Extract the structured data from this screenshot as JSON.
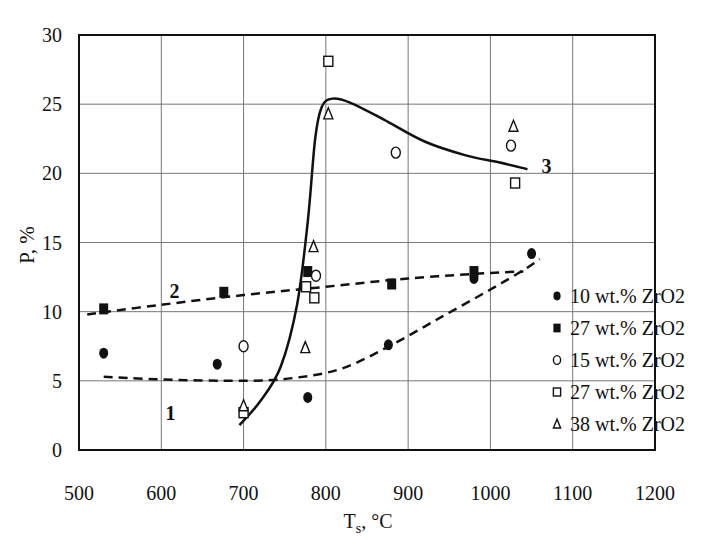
{
  "chart_data": {
    "type": "scatter",
    "title": "",
    "xlabel": "Ts, °C",
    "xlabel_main": "T",
    "xlabel_sub": "s",
    "xlabel_unit": ", °C",
    "ylabel": "P, %",
    "xlim": [
      500,
      1200
    ],
    "ylim": [
      0,
      30
    ],
    "x_ticks": [
      500,
      600,
      700,
      800,
      900,
      1000,
      1100,
      1200
    ],
    "y_ticks": [
      0,
      5,
      10,
      15,
      20,
      25,
      30
    ],
    "grid": true,
    "legend_position": "lower right (inside plot)",
    "series": [
      {
        "name": "10 wt.% ZrO2",
        "marker": "filled-circle",
        "points": [
          [
            530,
            7.0
          ],
          [
            668,
            6.2
          ],
          [
            778,
            3.8
          ],
          [
            876,
            7.6
          ],
          [
            980,
            12.4
          ],
          [
            1050,
            14.2
          ]
        ]
      },
      {
        "name": "27 wt.% ZrO2",
        "marker": "filled-square",
        "points": [
          [
            530,
            10.2
          ],
          [
            676,
            11.4
          ],
          [
            778,
            12.9
          ],
          [
            880,
            12.0
          ],
          [
            980,
            12.9
          ]
        ]
      },
      {
        "name": "15 wt.% ZrO2",
        "marker": "open-circle",
        "points": [
          [
            700,
            7.5
          ],
          [
            788,
            12.6
          ],
          [
            885,
            21.5
          ],
          [
            1025,
            22.0
          ]
        ]
      },
      {
        "name": "27 wt.% ZrO2",
        "marker": "open-square",
        "points": [
          [
            700,
            2.7
          ],
          [
            776,
            11.8
          ],
          [
            786,
            11.0
          ],
          [
            803,
            28.1
          ],
          [
            1030,
            19.3
          ]
        ]
      },
      {
        "name": "38 wt.% ZrO2",
        "marker": "open-triangle",
        "points": [
          [
            700,
            3.2
          ],
          [
            775,
            7.4
          ],
          [
            785,
            14.7
          ],
          [
            803,
            24.3
          ],
          [
            1028,
            23.4
          ]
        ]
      }
    ],
    "curves": [
      {
        "label": "1",
        "style": "dashed",
        "label_pos": [
          605,
          2.2
        ],
        "points": [
          [
            530,
            5.3
          ],
          [
            600,
            5.1
          ],
          [
            700,
            5.0
          ],
          [
            760,
            5.2
          ],
          [
            820,
            5.9
          ],
          [
            880,
            7.6
          ],
          [
            940,
            9.6
          ],
          [
            1000,
            11.6
          ],
          [
            1040,
            13.0
          ],
          [
            1060,
            13.8
          ]
        ]
      },
      {
        "label": "2",
        "style": "dashed",
        "label_pos": [
          610,
          11.0
        ],
        "points": [
          [
            510,
            9.8
          ],
          [
            600,
            10.5
          ],
          [
            700,
            11.2
          ],
          [
            800,
            11.8
          ],
          [
            900,
            12.4
          ],
          [
            1000,
            12.8
          ],
          [
            1040,
            12.9
          ]
        ]
      },
      {
        "label": "3",
        "style": "solid",
        "label_pos": [
          1062,
          20.0
        ],
        "points": [
          [
            695,
            1.8
          ],
          [
            720,
            3.5
          ],
          [
            745,
            6.0
          ],
          [
            765,
            10.5
          ],
          [
            778,
            16.5
          ],
          [
            787,
            22.5
          ],
          [
            795,
            24.8
          ],
          [
            808,
            25.4
          ],
          [
            830,
            25.1
          ],
          [
            870,
            23.9
          ],
          [
            920,
            22.3
          ],
          [
            970,
            21.3
          ],
          [
            1010,
            20.8
          ],
          [
            1045,
            20.3
          ]
        ]
      }
    ]
  }
}
